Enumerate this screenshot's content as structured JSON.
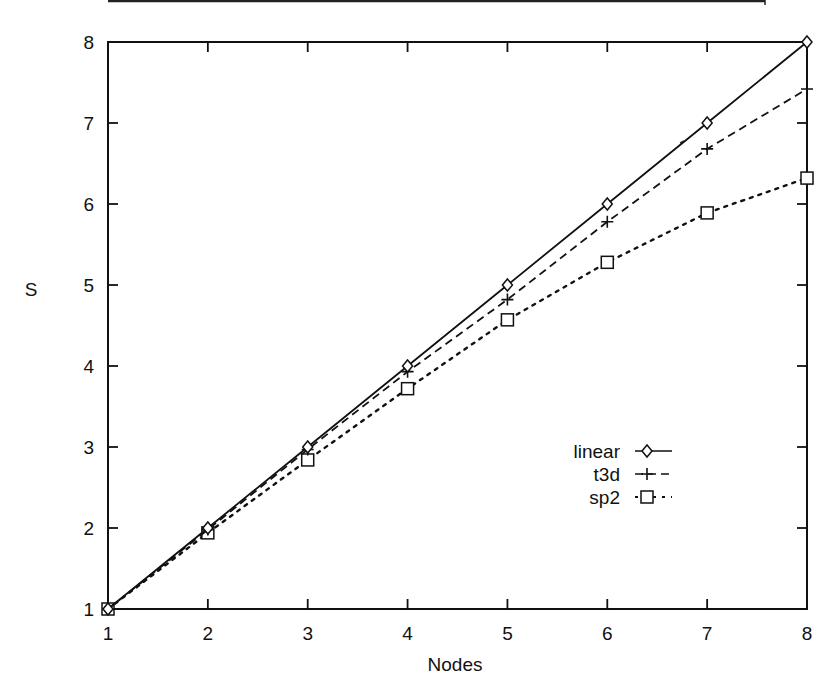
{
  "chart_data": {
    "type": "line",
    "title": "",
    "xlabel": "Nodes",
    "ylabel": "S",
    "x": [
      1,
      2,
      3,
      4,
      5,
      6,
      7,
      8
    ],
    "xlim": [
      1,
      8
    ],
    "ylim": [
      1,
      8
    ],
    "xticks": [
      "1",
      "2",
      "3",
      "4",
      "5",
      "6",
      "7",
      "8"
    ],
    "yticks": [
      "1",
      "2",
      "3",
      "4",
      "5",
      "6",
      "7",
      "8"
    ],
    "grid": false,
    "legend_position": "inside-lower-right",
    "series": [
      {
        "name": "linear",
        "marker": "diamond",
        "line": "solid",
        "values": [
          1,
          2,
          3,
          4,
          5,
          6,
          7,
          8
        ]
      },
      {
        "name": "t3d",
        "marker": "plus",
        "line": "dashed",
        "values": [
          1,
          1.98,
          2.97,
          3.93,
          4.82,
          5.78,
          6.68,
          7.42
        ]
      },
      {
        "name": "sp2",
        "marker": "square",
        "line": "dotted",
        "values": [
          1,
          1.94,
          2.84,
          3.72,
          4.57,
          5.28,
          5.89,
          6.32
        ]
      }
    ]
  },
  "colors": {
    "ink": "#111111",
    "background": "#ffffff"
  }
}
